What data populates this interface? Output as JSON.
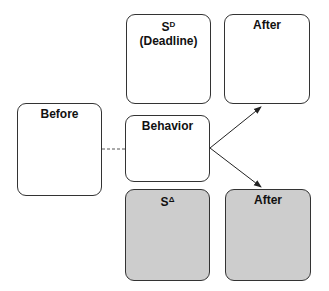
{
  "diagram": {
    "boxes": {
      "before": {
        "label": "Before"
      },
      "sd": {
        "label": "S",
        "superscript": "D",
        "sublabel": "(Deadline)"
      },
      "after_top": {
        "label": "After"
      },
      "behavior": {
        "label": "Behavior"
      },
      "sdelta": {
        "label": "S",
        "superscript": "Δ"
      },
      "after_bottom": {
        "label": "After"
      }
    },
    "colors": {
      "shaded": "#cdcdcd",
      "border": "#333333"
    }
  }
}
